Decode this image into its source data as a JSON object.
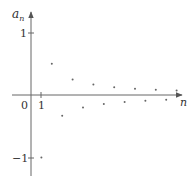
{
  "chart_data": {
    "type": "scatter",
    "title": "",
    "xlabel": "n",
    "ylabel": "a_n",
    "ylabel_main": "a",
    "ylabel_sub": "n",
    "origin_label": "0",
    "xticks": [
      {
        "value": 1,
        "label": "1"
      }
    ],
    "yticks": [
      {
        "value": 1,
        "label": "1"
      },
      {
        "value": -1,
        "label": "−1"
      }
    ],
    "grid": false,
    "legend": null,
    "xlim": [
      -1.9,
      13.5
    ],
    "ylim": [
      -1.3,
      1.3
    ],
    "x": [
      1,
      2,
      3,
      4,
      5,
      6,
      7,
      8,
      9,
      10,
      11,
      12,
      13,
      14
    ],
    "values": [
      -1,
      0.5,
      -0.3333,
      0.25,
      -0.2,
      0.1667,
      -0.1429,
      0.125,
      -0.1111,
      0.1,
      -0.0909,
      0.0833,
      -0.0769,
      0.0714
    ],
    "formula": "a_n = (-1)^n / n",
    "colors": {
      "axis": "#555555",
      "point": "#666666",
      "text": "#333333"
    }
  }
}
